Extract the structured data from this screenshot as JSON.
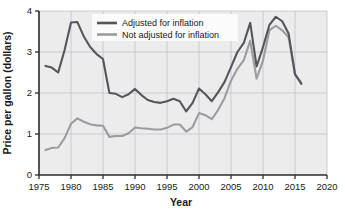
{
  "chart_data": {
    "type": "line",
    "title": "",
    "xlabel": "Year",
    "ylabel": "Price per gallon (dollars)",
    "xlim": [
      1975,
      2020
    ],
    "ylim": [
      0,
      4
    ],
    "xticks": [
      1975,
      1980,
      1985,
      1990,
      1995,
      2000,
      2005,
      2010,
      2015,
      2020
    ],
    "yticks": [
      0,
      1,
      2,
      3,
      4
    ],
    "xtick_labels": [
      "1975",
      "1980",
      "1985",
      "1990",
      "1995",
      "2000",
      "2005",
      "2010",
      "2015",
      "2020"
    ],
    "ytick_labels": [
      "0",
      "1",
      "2",
      "3",
      "4"
    ],
    "grid": true,
    "legend_position": "top-center",
    "colors": {
      "adjusted": "#55565a",
      "not_adjusted": "#9b9ca0",
      "plot_background": "#ececed",
      "gridline": "#c2c3c6",
      "axis": "#2b2b2b",
      "page_background": "#ffffff",
      "legend_background": "#fbfbfb"
    },
    "x": [
      1976,
      1977,
      1978,
      1979,
      1980,
      1981,
      1982,
      1983,
      1984,
      1985,
      1986,
      1987,
      1988,
      1989,
      1990,
      1991,
      1992,
      1993,
      1994,
      1995,
      1996,
      1997,
      1998,
      1999,
      2000,
      2001,
      2002,
      2003,
      2004,
      2005,
      2006,
      2007,
      2008,
      2009,
      2010,
      2011,
      2012,
      2013,
      2014,
      2015,
      2016
    ],
    "series": [
      {
        "name": "Adjusted for inflation",
        "color": "#55565a",
        "values": [
          2.66,
          2.62,
          2.5,
          3.05,
          3.72,
          3.73,
          3.38,
          3.12,
          2.95,
          2.83,
          2.0,
          1.98,
          1.9,
          1.97,
          2.1,
          1.95,
          1.83,
          1.78,
          1.76,
          1.8,
          1.86,
          1.8,
          1.55,
          1.76,
          2.11,
          1.97,
          1.8,
          2.02,
          2.27,
          2.63,
          3.0,
          3.22,
          3.71,
          2.65,
          3.12,
          3.66,
          3.86,
          3.75,
          3.45,
          2.46,
          2.22
        ]
      },
      {
        "name": "Not adjusted for inflation",
        "color": "#9b9ca0",
        "values": [
          0.61,
          0.66,
          0.67,
          0.9,
          1.25,
          1.38,
          1.3,
          1.24,
          1.21,
          1.2,
          0.93,
          0.95,
          0.95,
          1.02,
          1.16,
          1.14,
          1.13,
          1.11,
          1.11,
          1.15,
          1.23,
          1.23,
          1.06,
          1.17,
          1.51,
          1.46,
          1.36,
          1.59,
          1.88,
          2.3,
          2.59,
          2.8,
          3.27,
          2.35,
          2.79,
          3.53,
          3.64,
          3.53,
          3.36,
          2.45,
          2.25
        ]
      }
    ],
    "legend": [
      {
        "label": "Adjusted for inflation",
        "color": "#55565a"
      },
      {
        "label": "Not adjusted for inflation",
        "color": "#9b9ca0"
      }
    ]
  }
}
